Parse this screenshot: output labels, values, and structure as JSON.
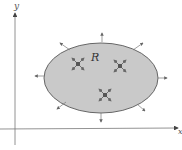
{
  "diagram": {
    "axes": {
      "x_label": "x",
      "y_label": "y"
    },
    "region": {
      "label": "R",
      "fill": "#c9c9c9",
      "stroke": "#555555"
    },
    "sources": 3,
    "outward_arrows": 8
  }
}
